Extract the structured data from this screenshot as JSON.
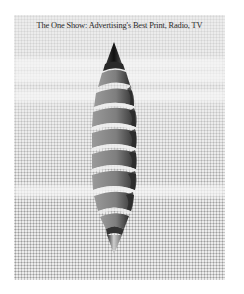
{
  "poster": {
    "title": "The One Show: Advertising's Best Print, Radio, TV",
    "artwork": "spiral-ribbon-spindle",
    "colors": {
      "background": "#ececec",
      "halftone_dot": "#5a5a5a",
      "ribbon_light": "#8a8a8a",
      "ribbon_dark": "#3a3a3a",
      "tip_dark": "#1e1e1e",
      "title_text": "#2a2a2a"
    },
    "ghost_bands_y": [
      43,
      56,
      75,
      170
    ]
  }
}
